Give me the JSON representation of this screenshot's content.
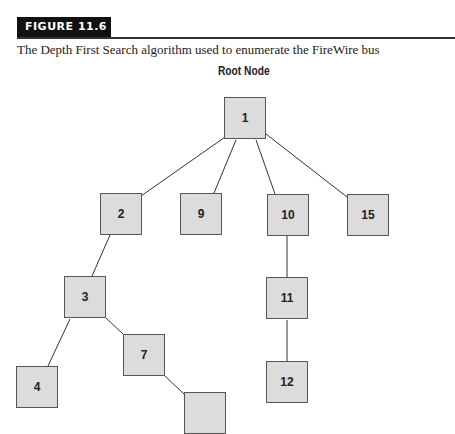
{
  "figure": {
    "label": "FIGURE 11.6",
    "caption": "The Depth First Search algorithm used to enumerate the FireWire bus",
    "root_label": "Root Node"
  },
  "nodes": [
    {
      "id": "1",
      "x": 224,
      "y": 97
    },
    {
      "id": "2",
      "x": 100,
      "y": 193
    },
    {
      "id": "9",
      "x": 180,
      "y": 193
    },
    {
      "id": "10",
      "x": 267,
      "y": 194
    },
    {
      "id": "15",
      "x": 347,
      "y": 194
    },
    {
      "id": "3",
      "x": 64,
      "y": 276
    },
    {
      "id": "11",
      "x": 266,
      "y": 277
    },
    {
      "id": "7",
      "x": 123,
      "y": 334
    },
    {
      "id": "4",
      "x": 16,
      "y": 366
    },
    {
      "id": "12",
      "x": 266,
      "y": 361
    },
    {
      "id": "",
      "x": 184,
      "y": 392
    }
  ],
  "edges": [
    [
      "1",
      "2"
    ],
    [
      "1",
      "9"
    ],
    [
      "1",
      "10"
    ],
    [
      "1",
      "15"
    ],
    [
      "2",
      "3"
    ],
    [
      "3",
      "4"
    ],
    [
      "3",
      "7"
    ],
    [
      "7",
      ""
    ],
    [
      "10",
      "11"
    ],
    [
      "11",
      "12"
    ]
  ]
}
